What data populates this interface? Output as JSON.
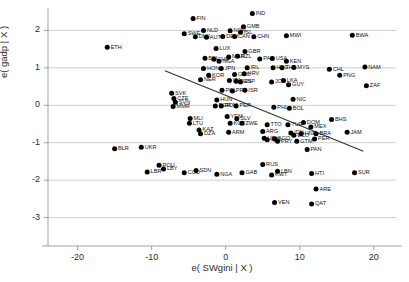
{
  "chart_data": {
    "type": "scatter",
    "title": "",
    "xlabel": "e( SWgini | X )",
    "ylabel": "e( gadp | X )",
    "xlim": [
      -24,
      23
    ],
    "ylim": [
      -3.6,
      2.6
    ],
    "xticks": [
      -20,
      -10,
      0,
      10,
      20
    ],
    "yticks": [
      2,
      1,
      0,
      -1,
      -2,
      -3
    ],
    "grid": true,
    "grid_axis": "y",
    "legend": "none",
    "marker": "filled-circle",
    "marker_color": "#000000",
    "fitline": {
      "name": "linear fit",
      "x0": -8.2,
      "y0": 0.92,
      "x1": 18.6,
      "y1": -1.23,
      "color": "#333333"
    },
    "points": [
      {
        "label": "FIN",
        "x": -4.4,
        "y": 2.32
      },
      {
        "label": "IND",
        "x": 3.6,
        "y": 2.45
      },
      {
        "label": "GMB",
        "x": 2.4,
        "y": 2.1
      },
      {
        "label": "NLD",
        "x": -3.0,
        "y": 2.0
      },
      {
        "label": "NOR",
        "x": 0.6,
        "y": 1.99
      },
      {
        "label": "SWE",
        "x": -5.6,
        "y": 1.91
      },
      {
        "label": "ISL",
        "x": 2.0,
        "y": 1.95
      },
      {
        "label": "DNK",
        "x": -4.1,
        "y": 1.83
      },
      {
        "label": "AUT",
        "x": -2.6,
        "y": 1.82
      },
      {
        "label": "DEU",
        "x": -0.4,
        "y": 1.84
      },
      {
        "label": "CAN",
        "x": 1.2,
        "y": 1.84
      },
      {
        "label": "CHN",
        "x": 3.8,
        "y": 1.83
      },
      {
        "label": "MWI",
        "x": 8.2,
        "y": 1.86
      },
      {
        "label": "BWA",
        "x": 17.1,
        "y": 1.87
      },
      {
        "label": "ETH",
        "x": -16.0,
        "y": 1.55
      },
      {
        "label": "LUX",
        "x": -1.3,
        "y": 1.52
      },
      {
        "label": "GBR",
        "x": 2.6,
        "y": 1.44
      },
      {
        "label": "MAR",
        "x": 0.4,
        "y": 1.29
      },
      {
        "label": "NZL",
        "x": 1.6,
        "y": 1.31
      },
      {
        "label": "BEL",
        "x": -2.8,
        "y": 1.26
      },
      {
        "label": "CHE",
        "x": -1.6,
        "y": 1.23
      },
      {
        "label": "NGA",
        "x": -0.9,
        "y": 1.18
      },
      {
        "label": "PAN",
        "x": 4.6,
        "y": 1.24
      },
      {
        "label": "USA",
        "x": 6.3,
        "y": 1.25
      },
      {
        "label": "KEN",
        "x": 8.2,
        "y": 1.18
      },
      {
        "label": "NAM",
        "x": 18.8,
        "y": 1.02
      },
      {
        "label": "HON",
        "x": -3.0,
        "y": 0.98
      },
      {
        "label": "JPN",
        "x": -0.6,
        "y": 0.98
      },
      {
        "label": "IRL",
        "x": 2.9,
        "y": 1.0
      },
      {
        "label": "HKG",
        "x": 6.4,
        "y": 1.0
      },
      {
        "label": "THA",
        "x": 7.6,
        "y": 1.0
      },
      {
        "label": "MYS",
        "x": 9.2,
        "y": 1.01
      },
      {
        "label": "CHL",
        "x": 14.0,
        "y": 0.96
      },
      {
        "label": "KOR",
        "x": -2.3,
        "y": 0.8
      },
      {
        "label": "GRC",
        "x": 1.2,
        "y": 0.82
      },
      {
        "label": "HRV",
        "x": 2.5,
        "y": 0.84
      },
      {
        "label": "PNG",
        "x": 15.4,
        "y": 0.8
      },
      {
        "label": "NER",
        "x": -3.4,
        "y": 0.68
      },
      {
        "label": "ITA",
        "x": 0.5,
        "y": 0.66
      },
      {
        "label": "TUN",
        "x": 1.4,
        "y": 0.64
      },
      {
        "label": "ESP",
        "x": 2.0,
        "y": 0.62
      },
      {
        "label": "LKA",
        "x": 7.8,
        "y": 0.66
      },
      {
        "label": "JOR",
        "x": 6.2,
        "y": 0.62
      },
      {
        "label": "GUY",
        "x": 8.5,
        "y": 0.55
      },
      {
        "label": "ZAF",
        "x": 19.0,
        "y": 0.52
      },
      {
        "label": "SVK",
        "x": -7.3,
        "y": 0.32
      },
      {
        "label": "POL",
        "x": -0.5,
        "y": 0.4
      },
      {
        "label": "PRT",
        "x": 0.9,
        "y": 0.38
      },
      {
        "label": "ISR",
        "x": 2.6,
        "y": 0.4
      },
      {
        "label": "CZE",
        "x": -7.0,
        "y": 0.18
      },
      {
        "label": "SVN",
        "x": -6.8,
        "y": 0.08
      },
      {
        "label": "HUN",
        "x": -1.2,
        "y": 0.14
      },
      {
        "label": "NIC",
        "x": 9.1,
        "y": 0.16
      },
      {
        "label": "MMR",
        "x": -7.1,
        "y": -0.03
      },
      {
        "label": "BGR",
        "x": -1.4,
        "y": -0.02
      },
      {
        "label": "ROM",
        "x": -0.6,
        "y": -0.02
      },
      {
        "label": "PER",
        "x": 1.4,
        "y": -0.02
      },
      {
        "label": "PHL",
        "x": 6.5,
        "y": -0.05
      },
      {
        "label": "BOL",
        "x": 8.6,
        "y": -0.08
      },
      {
        "label": "MLI",
        "x": -4.8,
        "y": -0.35
      },
      {
        "label": "YEM",
        "x": 0.2,
        "y": -0.3
      },
      {
        "label": "SLV",
        "x": 1.5,
        "y": -0.36
      },
      {
        "label": "BHS",
        "x": 14.3,
        "y": -0.38
      },
      {
        "label": "LTU",
        "x": -4.9,
        "y": -0.48
      },
      {
        "label": "KGZ",
        "x": 0.6,
        "y": -0.48
      },
      {
        "label": "ZWE",
        "x": 2.2,
        "y": -0.48
      },
      {
        "label": "DOM",
        "x": 10.5,
        "y": -0.46
      },
      {
        "label": "TTO",
        "x": 5.6,
        "y": -0.52
      },
      {
        "label": "TUR",
        "x": 8.4,
        "y": -0.52
      },
      {
        "label": "MEX",
        "x": 11.5,
        "y": -0.58
      },
      {
        "label": "KAZ",
        "x": -3.6,
        "y": -0.66
      },
      {
        "label": "DZA",
        "x": -3.4,
        "y": -0.76
      },
      {
        "label": "ARM",
        "x": 0.4,
        "y": -0.72
      },
      {
        "label": "ARG",
        "x": 5.0,
        "y": -0.7
      },
      {
        "label": "IDN",
        "x": 8.8,
        "y": -0.74
      },
      {
        "label": "HND",
        "x": 10.2,
        "y": -0.76
      },
      {
        "label": "BRA",
        "x": 12.2,
        "y": -0.76
      },
      {
        "label": "ECU",
        "x": 9.2,
        "y": -0.8
      },
      {
        "label": "JAM",
        "x": 16.4,
        "y": -0.72
      },
      {
        "label": "PER",
        "x": 12.0,
        "y": -0.9
      },
      {
        "label": "COL",
        "x": 5.6,
        "y": -0.92
      },
      {
        "label": "URY",
        "x": 5.2,
        "y": -0.88
      },
      {
        "label": "AGO",
        "x": 6.6,
        "y": -0.9
      },
      {
        "label": "PRY",
        "x": 7.0,
        "y": -0.96
      },
      {
        "label": "GTM",
        "x": 9.6,
        "y": -0.96
      },
      {
        "label": "BLR",
        "x": -15.0,
        "y": -1.16
      },
      {
        "label": "UKR",
        "x": -11.4,
        "y": -1.12
      },
      {
        "label": "PAN",
        "x": 11.0,
        "y": -1.18
      },
      {
        "label": "ROU",
        "x": -9.0,
        "y": -1.6
      },
      {
        "label": "LBY",
        "x": -8.4,
        "y": -1.7
      },
      {
        "label": "RUS",
        "x": 5.0,
        "y": -1.58
      },
      {
        "label": "LBR",
        "x": -10.6,
        "y": -1.78
      },
      {
        "label": "SDN",
        "x": -4.0,
        "y": -1.74
      },
      {
        "label": "COD",
        "x": -5.6,
        "y": -1.8
      },
      {
        "label": "NGA",
        "x": -1.2,
        "y": -1.84
      },
      {
        "label": "GAB",
        "x": 2.2,
        "y": -1.8
      },
      {
        "label": "KWT",
        "x": 6.2,
        "y": -1.86
      },
      {
        "label": "LBN",
        "x": 7.0,
        "y": -1.76
      },
      {
        "label": "HTI",
        "x": 11.6,
        "y": -1.82
      },
      {
        "label": "SUR",
        "x": 17.4,
        "y": -1.8
      },
      {
        "label": "ARE",
        "x": 12.2,
        "y": -2.24
      },
      {
        "label": "VEN",
        "x": 6.6,
        "y": -2.6
      },
      {
        "label": "QAT",
        "x": 11.6,
        "y": -2.64
      }
    ]
  }
}
